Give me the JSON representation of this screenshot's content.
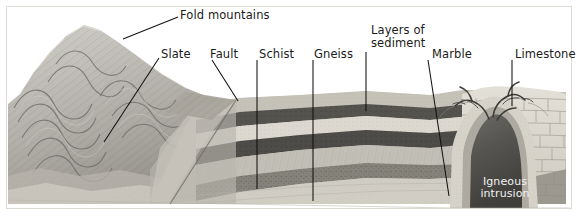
{
  "figure": {
    "kind": "geological-cross-section-diagram",
    "title_visible": false,
    "background_color": "#ffffff",
    "border_color": "#d8d8d4",
    "labels": [
      {
        "id": "fold-mountains",
        "text": "Fold mountains",
        "x": 180,
        "y": 9,
        "color": "#1b1b1b"
      },
      {
        "id": "slate",
        "text": "Slate",
        "x": 161,
        "y": 48,
        "color": "#1b1b1b"
      },
      {
        "id": "fault",
        "text": "Fault",
        "x": 210,
        "y": 48,
        "color": "#1b1b1b"
      },
      {
        "id": "schist",
        "text": "Schist",
        "x": 259,
        "y": 48,
        "color": "#1b1b1b"
      },
      {
        "id": "gneiss",
        "text": "Gneiss",
        "x": 314,
        "y": 48,
        "color": "#1b1b1b"
      },
      {
        "id": "layers-of-sediment",
        "text": "Layers of\nsediment",
        "x": 371,
        "y": 24,
        "color": "#1b1b1b"
      },
      {
        "id": "marble",
        "text": "Marble",
        "x": 432,
        "y": 48,
        "color": "#1b1b1b"
      },
      {
        "id": "limestone",
        "text": "Limestone",
        "x": 515,
        "y": 48,
        "color": "#1b1b1b"
      },
      {
        "id": "igneous-intrusion",
        "text": "Igneous\nintrusion",
        "x": 464,
        "y": 176,
        "color": "#f2f2f2"
      }
    ],
    "leader_lines": [
      {
        "id": "fold-mountains-leader",
        "from_x": 178,
        "from_y": 17,
        "to_x": 123,
        "to_y": 39
      },
      {
        "id": "slate-leader",
        "from_x": 159,
        "from_y": 58,
        "to_x": 104,
        "to_y": 142
      },
      {
        "id": "fault-leader",
        "from_x": 212,
        "from_y": 60,
        "to_x": 238,
        "to_y": 101
      },
      {
        "id": "schist-leader",
        "from_x": 257,
        "from_y": 60,
        "to_x": 257,
        "to_y": 189
      },
      {
        "id": "gneiss-leader",
        "from_x": 313,
        "from_y": 60,
        "to_x": 313,
        "to_y": 201
      },
      {
        "id": "layers-leader",
        "from_x": 366,
        "from_y": 52,
        "to_x": 366,
        "to_y": 111
      },
      {
        "id": "marble-leader",
        "from_x": 428,
        "from_y": 60,
        "to_x": 449,
        "to_y": 196
      },
      {
        "id": "limestone-leader",
        "from_x": 512,
        "from_y": 60,
        "to_x": 512,
        "to_y": 106
      }
    ],
    "palette": {
      "sky": "#ffffff",
      "mountain_light": "#c9c9c4",
      "mountain_mid": "#a9a9a3",
      "mountain_dark": "#8a8a84",
      "stratum_pale": "#dcdad2",
      "stratum_light": "#c6c4bb",
      "stratum_mid": "#a3a199",
      "stratum_dark": "#6e6d67",
      "stratum_darkest": "#4a4946",
      "limestone": "#ddd9cf",
      "limestone_line": "#9b968c",
      "intrusion": "#5c5a56",
      "intrusion_core": "#4b4947",
      "marble_band": "#cfccc2",
      "basement": "#cfcdc5",
      "leader_line": "#111111"
    },
    "strata": [
      {
        "name": "topsoil-sediment-cap",
        "tone": "#c8c5bc"
      },
      {
        "name": "dark-band-upper",
        "tone": "#56544f"
      },
      {
        "name": "pale-band",
        "tone": "#dedcd4"
      },
      {
        "name": "dark-band-lower",
        "tone": "#4f4d49"
      },
      {
        "name": "mid-band",
        "tone": "#b5b2a9"
      },
      {
        "name": "speckled-band",
        "tone": "#8b8880"
      },
      {
        "name": "basement-pale",
        "tone": "#cfccc3"
      }
    ]
  }
}
